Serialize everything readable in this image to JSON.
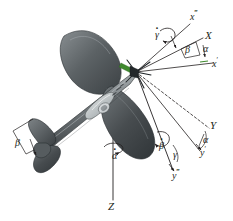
{
  "figure": {
    "name": "aircraft-euler-angle-diagram",
    "background_color": "#ffffff",
    "line_color": "#231f20",
    "body_color_dark": "#44494c",
    "body_color_mid": "#6e7478",
    "body_color_light": "#9aa0a3",
    "spinner_color": "#3f8a2e",
    "width": 233,
    "height": 221
  },
  "axes": [
    {
      "id": "x-triple-prime",
      "base": "x",
      "prime": "‴",
      "label": "x‴"
    },
    {
      "id": "x-capital",
      "base": "X",
      "prime": "",
      "label": "X"
    },
    {
      "id": "x-prime",
      "base": "x",
      "prime": "′",
      "label": "x′"
    },
    {
      "id": "y-capital",
      "base": "Y",
      "prime": "",
      "label": "Y"
    },
    {
      "id": "y-prime",
      "base": "y",
      "prime": "′",
      "label": "y′"
    },
    {
      "id": "y-triple-prime",
      "base": "y",
      "prime": "‴",
      "label": "y‴"
    },
    {
      "id": "z-capital",
      "base": "Z",
      "prime": "",
      "label": "Z"
    }
  ],
  "angles": [
    {
      "id": "alpha-upper-right",
      "symbol": "α",
      "label": "α"
    },
    {
      "id": "beta-upper-right",
      "symbol": "β",
      "label": "β"
    },
    {
      "id": "alpha-right",
      "symbol": "α",
      "label": "α"
    },
    {
      "id": "gamma-lower-right",
      "symbol": "γ",
      "label": "γ"
    },
    {
      "id": "beta-left-wing",
      "symbol": "β",
      "label": "β"
    }
  ],
  "rates": [
    {
      "id": "gamma-dot",
      "symbol": "γ",
      "label": "γ",
      "overdot": true
    },
    {
      "id": "beta-dot",
      "symbol": "β",
      "label": "β",
      "overdot": true
    },
    {
      "id": "alpha-dot",
      "symbol": "α",
      "label": "α",
      "overdot": true
    }
  ],
  "labels": {
    "x_triple_prime": {
      "base": "x",
      "prime": "‴"
    },
    "x_capital": {
      "base": "X",
      "prime": ""
    },
    "x_prime": {
      "base": "x",
      "prime": "′"
    },
    "y_capital": {
      "base": "Y",
      "prime": ""
    },
    "y_prime": {
      "base": "y",
      "prime": "′"
    },
    "y_triple_prime": {
      "base": "y",
      "prime": "‴"
    },
    "z_capital": {
      "base": "Z",
      "prime": ""
    },
    "alpha_ur": "α",
    "beta_ur": "β",
    "alpha_r": "α",
    "gamma_lr": "γ",
    "beta_wing": "β",
    "gamma_dot": "γ",
    "beta_dot": "β",
    "alpha_dot": "α"
  }
}
